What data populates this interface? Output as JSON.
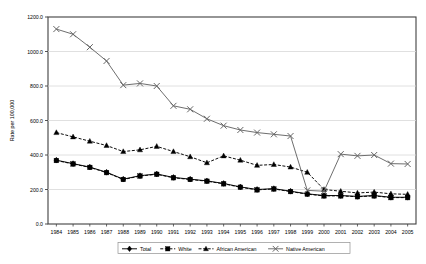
{
  "chart_data": {
    "type": "line",
    "title": "",
    "xlabel": "",
    "ylabel": "Rate per 100,000",
    "ylim": [
      0,
      1200
    ],
    "ytick_labels": [
      "0.0",
      "200.0",
      "400.0",
      "600.0",
      "800.0",
      "1000.0",
      "1200.0"
    ],
    "ytick_values": [
      0,
      200,
      400,
      600,
      800,
      1000,
      1200
    ],
    "grid": true,
    "legend_position": "bottom",
    "categories": [
      "1984",
      "1985",
      "1986",
      "1987",
      "1988",
      "1989",
      "1990",
      "1991",
      "1992",
      "1993",
      "1994",
      "1995",
      "1996",
      "1997",
      "1998",
      "1999",
      "2000",
      "2001",
      "2002",
      "2003",
      "2004",
      "2005"
    ],
    "series": [
      {
        "name": "Total",
        "marker": "diamond",
        "line": "solid",
        "color": "#000000",
        "values": [
          370,
          350,
          330,
          300,
          260,
          280,
          290,
          270,
          260,
          250,
          235,
          215,
          200,
          205,
          190,
          175,
          165,
          165,
          160,
          165,
          155,
          155
        ]
      },
      {
        "name": "White",
        "marker": "square",
        "line": "dashed",
        "color": "#000000",
        "values": [
          368,
          348,
          328,
          298,
          258,
          278,
          288,
          268,
          258,
          248,
          233,
          213,
          198,
          203,
          188,
          173,
          163,
          163,
          158,
          163,
          153,
          153
        ]
      },
      {
        "name": "African American",
        "marker": "triangle",
        "line": "dashed",
        "color": "#000000",
        "values": [
          530,
          505,
          480,
          455,
          420,
          430,
          450,
          420,
          390,
          355,
          395,
          370,
          340,
          345,
          330,
          300,
          200,
          190,
          180,
          185,
          175,
          172
        ]
      },
      {
        "name": "Native American",
        "marker": "x",
        "line": "solid",
        "color": "#666666",
        "values": [
          1130,
          1100,
          1025,
          945,
          805,
          815,
          800,
          685,
          665,
          610,
          570,
          545,
          530,
          520,
          510,
          195,
          190,
          405,
          395,
          400,
          350,
          348
        ]
      }
    ]
  },
  "legend": {
    "items": [
      {
        "label": "Total"
      },
      {
        "label": "White"
      },
      {
        "label": "African American"
      },
      {
        "label": "Native American"
      }
    ]
  }
}
